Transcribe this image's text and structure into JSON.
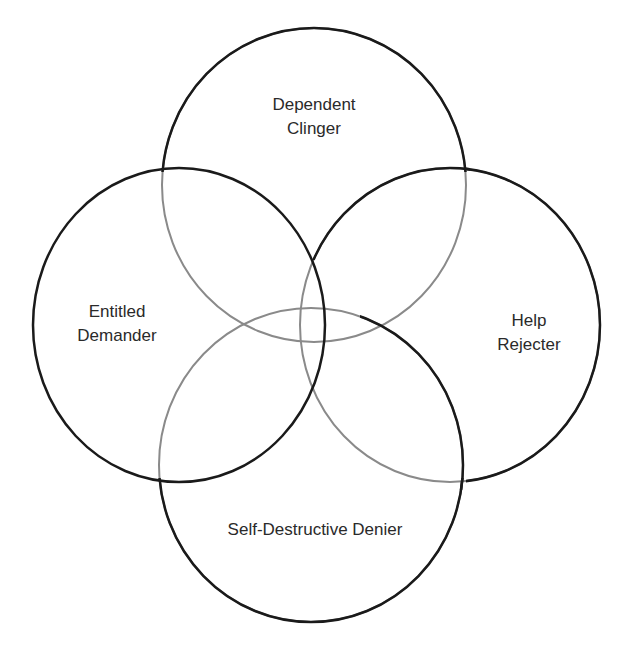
{
  "diagram": {
    "type": "four-circle-venn",
    "colors": {
      "stroke_dark": "#1a1a1a",
      "stroke_light": "#8a8a8a",
      "text": "#2a2a2a",
      "background": "#ffffff"
    },
    "circles": [
      {
        "id": "dependent-clinger",
        "lines": [
          "Dependent",
          "Clinger"
        ]
      },
      {
        "id": "entitled-demander",
        "lines": [
          "Entitled",
          "Demander"
        ]
      },
      {
        "id": "help-rejecter",
        "lines": [
          "Help",
          "Rejecter"
        ]
      },
      {
        "id": "self-destructive-denier",
        "lines": [
          "Self-Destructive Denier"
        ]
      }
    ]
  }
}
